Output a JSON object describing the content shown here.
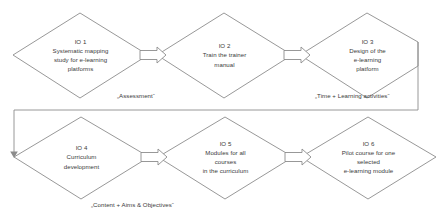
{
  "diagram": {
    "line_color": "#8c8c8c",
    "text_color": "#3a3a3a",
    "nodes": [
      {
        "id": "io1",
        "code": "IO 1",
        "desc": "Systematic mapping\nstudy for e-learning\nplatforms"
      },
      {
        "id": "io2",
        "code": "IO 2",
        "desc": "Train the trainer\nmanual"
      },
      {
        "id": "io3",
        "code": "IO 3",
        "desc": "Design of the\ne-learning\nplatform"
      },
      {
        "id": "io4",
        "code": "IO 4",
        "desc": "Curriculum\ndevelopment"
      },
      {
        "id": "io5",
        "code": "IO 5",
        "desc": "Modules for all\ncourses\nin the curriculum"
      },
      {
        "id": "io6",
        "code": "IO 6",
        "desc": "Pilot course for one\nselected\ne-learning module"
      }
    ],
    "annotations": [
      {
        "id": "assessment",
        "text": "„Assessment“"
      },
      {
        "id": "time-learning",
        "text": "„Time + Learning activities“"
      },
      {
        "id": "content-aims",
        "text": "„Content + Aims & Objectives“"
      }
    ],
    "connectors": [
      {
        "id": "io1-io2",
        "type": "block-arrow",
        "direction": "right"
      },
      {
        "id": "io2-io3",
        "type": "block-arrow",
        "direction": "right"
      },
      {
        "id": "io3-io4",
        "type": "routed-line",
        "direction": "down-left"
      },
      {
        "id": "io4-io5",
        "type": "block-arrow",
        "direction": "right"
      },
      {
        "id": "io5-io6",
        "type": "block-arrow",
        "direction": "right"
      }
    ]
  }
}
